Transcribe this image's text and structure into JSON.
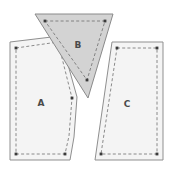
{
  "figure": {
    "background": "#ffffff",
    "canvas": {
      "width": 174,
      "height": 173
    },
    "shapes": [
      {
        "id": "shape-a",
        "label": "A",
        "kind": "pentagon",
        "fill": "#f4f4f4",
        "stroke": "#8f8f8f",
        "stroke_width": 1,
        "dash_stroke": "#6e6e6e",
        "vertex_color": "#3a3a3a",
        "outline_points": "10,42 60,36 77,97 74,137 70,160 10,160",
        "dashed_points": "16,48 58,42 72,98 69,136 65,154 16,154",
        "vertices": [
          [
            58,
            42
          ],
          [
            72,
            98
          ],
          [
            65,
            154
          ],
          [
            16,
            154
          ],
          [
            16,
            48
          ]
        ],
        "label_position": {
          "x": 41,
          "y": 103
        }
      },
      {
        "id": "shape-b",
        "label": "B",
        "kind": "triangle",
        "fill": "#d3d3d3",
        "stroke": "#8a8a8a",
        "stroke_width": 1,
        "dash_stroke": "#6e6e6e",
        "vertex_color": "#3a3a3a",
        "outline_points": "35,14 113,14 88,98",
        "dashed_points": "45,21 105,21 87,80",
        "vertices": [
          [
            45,
            21
          ],
          [
            105,
            21
          ],
          [
            87,
            80
          ]
        ],
        "label_position": {
          "x": 78,
          "y": 45
        }
      },
      {
        "id": "shape-c",
        "label": "C",
        "kind": "quadrilateral",
        "fill": "#f4f4f4",
        "stroke": "#8f8f8f",
        "stroke_width": 1,
        "dash_stroke": "#6e6e6e",
        "vertex_color": "#3a3a3a",
        "outline_points": "112,42 163,42 163,160 95,160",
        "dashed_points": "117,48 157,48 157,154 101,154",
        "vertices": [
          [
            117,
            48
          ],
          [
            157,
            48
          ],
          [
            157,
            154
          ],
          [
            101,
            154
          ]
        ],
        "label_position": {
          "x": 127,
          "y": 104
        }
      }
    ]
  }
}
